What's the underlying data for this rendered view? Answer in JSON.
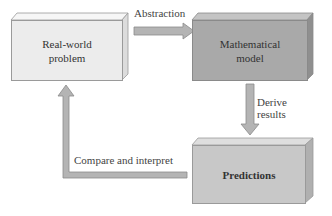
{
  "diagram": {
    "nodes": [
      {
        "id": "real_world",
        "label_line1": "Real-world",
        "label_line2": "problem",
        "fill": "#ececec"
      },
      {
        "id": "math_model",
        "label_line1": "Mathematical",
        "label_line2": "model",
        "fill": "#a9a9a9"
      },
      {
        "id": "predictions",
        "label_line1": "Predictions",
        "fill": "#c8c8c8"
      }
    ],
    "edges": [
      {
        "from": "real_world",
        "to": "math_model",
        "label": "Abstraction"
      },
      {
        "from": "math_model",
        "to": "predictions",
        "label_line1": "Derive",
        "label_line2": "results"
      },
      {
        "from": "predictions",
        "to": "real_world",
        "label": "Compare and interpret"
      }
    ],
    "colors": {
      "arrow_fill": "#b4b4b4",
      "arrow_stroke": "#8a8a8a",
      "text": "#333333"
    }
  }
}
